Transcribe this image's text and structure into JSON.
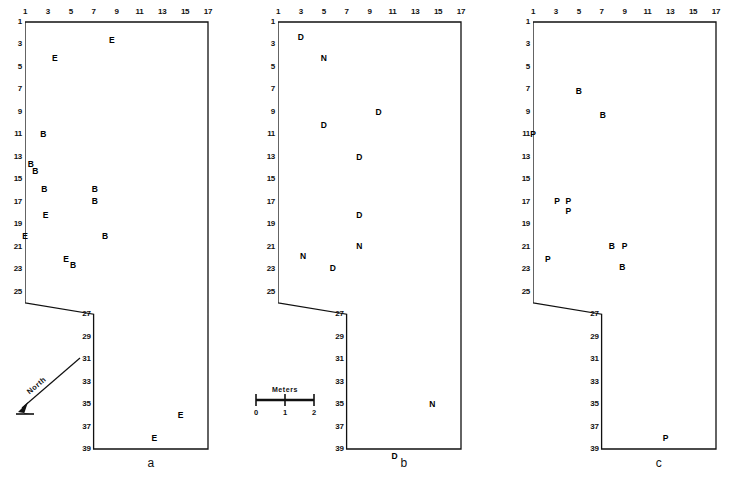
{
  "figure": {
    "type": "archaeological-site-plan",
    "panel_count": 3,
    "grid": {
      "col_labels": [
        "1",
        "3",
        "5",
        "7",
        "9",
        "11",
        "13",
        "15",
        "17"
      ],
      "col_values": [
        1,
        3,
        5,
        7,
        9,
        11,
        13,
        15,
        17
      ],
      "row_labels_upper": [
        "1",
        "3",
        "5",
        "7",
        "9",
        "11",
        "13",
        "15",
        "17",
        "19",
        "21",
        "23",
        "25"
      ],
      "row_values_upper": [
        1,
        3,
        5,
        7,
        9,
        11,
        13,
        15,
        17,
        19,
        21,
        23,
        25
      ],
      "row_labels_lower": [
        "27",
        "29",
        "31",
        "33",
        "35",
        "37",
        "39"
      ],
      "row_values_lower": [
        27,
        29,
        31,
        33,
        35,
        37,
        39
      ]
    },
    "outline_note": "L-shaped excavation block: wide upper rectangle cols 1-17 rows 1-26, narrower lower rectangle cols 7-17 rows 27-39"
  },
  "north_arrow": {
    "label": "North"
  },
  "scale_bar": {
    "title": "Meters",
    "ticks": [
      "0",
      "1",
      "2"
    ],
    "tick_values": [
      0,
      1,
      2
    ]
  },
  "panels": [
    {
      "id": "a",
      "label": "a",
      "marks": [
        {
          "code": "E",
          "col": 8.6,
          "row": 2.6
        },
        {
          "code": "E",
          "col": 3.6,
          "row": 4.2
        },
        {
          "code": "B",
          "col": 2.6,
          "row": 11.0
        },
        {
          "code": "B",
          "col": 1.5,
          "row": 13.6
        },
        {
          "code": "B",
          "col": 1.9,
          "row": 14.3
        },
        {
          "code": "B",
          "col": 2.7,
          "row": 15.9
        },
        {
          "code": "B",
          "col": 7.1,
          "row": 15.9
        },
        {
          "code": "B",
          "col": 7.1,
          "row": 16.9
        },
        {
          "code": "E",
          "col": 2.8,
          "row": 18.2
        },
        {
          "code": "E",
          "col": 1.0,
          "row": 20.0
        },
        {
          "code": "B",
          "col": 8.0,
          "row": 20.0
        },
        {
          "code": "E",
          "col": 4.6,
          "row": 22.1
        },
        {
          "code": "B",
          "col": 5.2,
          "row": 22.6
        },
        {
          "code": "E",
          "col": 14.6,
          "row": 36.0
        },
        {
          "code": "E",
          "col": 12.3,
          "row": 38.0
        }
      ]
    },
    {
      "id": "b",
      "label": "b",
      "marks": [
        {
          "code": "D",
          "col": 3.0,
          "row": 2.3
        },
        {
          "code": "N",
          "col": 5.0,
          "row": 4.2
        },
        {
          "code": "D",
          "col": 9.8,
          "row": 9.0
        },
        {
          "code": "D",
          "col": 5.0,
          "row": 10.2
        },
        {
          "code": "D",
          "col": 8.1,
          "row": 13.0
        },
        {
          "code": "D",
          "col": 8.1,
          "row": 18.2
        },
        {
          "code": "N",
          "col": 8.1,
          "row": 20.9
        },
        {
          "code": "N",
          "col": 3.2,
          "row": 21.8
        },
        {
          "code": "D",
          "col": 5.8,
          "row": 22.9
        },
        {
          "code": "N",
          "col": 14.5,
          "row": 35.0
        },
        {
          "code": "D",
          "col": 11.2,
          "row": 39.6
        }
      ]
    },
    {
      "id": "c",
      "label": "c",
      "marks": [
        {
          "code": "B",
          "col": 5.0,
          "row": 7.1
        },
        {
          "code": "B",
          "col": 7.1,
          "row": 9.3
        },
        {
          "code": "P",
          "col": 1.0,
          "row": 11.0
        },
        {
          "code": "P",
          "col": 3.1,
          "row": 16.9
        },
        {
          "code": "P",
          "col": 4.1,
          "row": 16.9
        },
        {
          "code": "P",
          "col": 4.1,
          "row": 17.8
        },
        {
          "code": "B",
          "col": 7.9,
          "row": 20.9
        },
        {
          "code": "P",
          "col": 9.0,
          "row": 20.9
        },
        {
          "code": "P",
          "col": 2.3,
          "row": 22.1
        },
        {
          "code": "B",
          "col": 8.8,
          "row": 22.8
        },
        {
          "code": "P",
          "col": 12.6,
          "row": 38.0
        }
      ]
    }
  ]
}
